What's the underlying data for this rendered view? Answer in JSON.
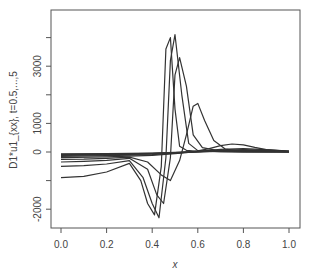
{
  "chart_data": {
    "type": "line",
    "title": "",
    "xlabel": "x",
    "ylabel": "D1*u1_{xx}, t=0.5,...,5",
    "xlim": [
      0.0,
      1.0
    ],
    "ylim": [
      -2600,
      5200
    ],
    "x_ticks": [
      "0.0",
      "0.2",
      "0.4",
      "0.6",
      "0.8",
      "1.0"
    ],
    "y_ticks": [
      "-2000",
      "0",
      "1000",
      "3000"
    ],
    "grid": false,
    "legend": null,
    "series": [
      {
        "name": "t=0.5",
        "x": [
          0,
          0.1,
          0.2,
          0.3,
          0.35,
          0.38,
          0.41,
          0.44,
          0.46,
          0.48,
          0.5,
          0.52,
          0.55,
          0.6,
          0.7,
          0.8,
          1.0
        ],
        "values": [
          -900,
          -850,
          -700,
          -400,
          -1000,
          -1800,
          -2200,
          -500,
          3600,
          4000,
          1500,
          200,
          60,
          20,
          10,
          5,
          0
        ]
      },
      {
        "name": "t=1.0",
        "x": [
          0,
          0.1,
          0.2,
          0.3,
          0.36,
          0.4,
          0.43,
          0.46,
          0.48,
          0.5,
          0.53,
          0.56,
          0.6,
          0.7,
          0.8,
          1.0
        ],
        "values": [
          -500,
          -480,
          -420,
          -300,
          -900,
          -1800,
          -2300,
          -200,
          3200,
          4100,
          2000,
          300,
          50,
          10,
          5,
          0
        ]
      },
      {
        "name": "t=1.5",
        "x": [
          0,
          0.1,
          0.2,
          0.3,
          0.38,
          0.42,
          0.45,
          0.48,
          0.5,
          0.52,
          0.55,
          0.58,
          0.62,
          0.7,
          0.8,
          1.0
        ],
        "values": [
          -350,
          -330,
          -290,
          -220,
          -600,
          -1500,
          -1800,
          -200,
          2700,
          3300,
          2300,
          600,
          150,
          30,
          10,
          0
        ]
      },
      {
        "name": "t=2.0",
        "x": [
          0,
          0.1,
          0.2,
          0.3,
          0.38,
          0.44,
          0.48,
          0.52,
          0.55,
          0.58,
          0.6,
          0.63,
          0.67,
          0.72,
          0.8,
          1.0
        ],
        "values": [
          -260,
          -250,
          -220,
          -180,
          -350,
          -800,
          -1000,
          -300,
          600,
          1600,
          1700,
          1100,
          400,
          100,
          20,
          0
        ]
      },
      {
        "name": "t=2.5",
        "x": [
          0,
          0.2,
          0.4,
          0.5,
          0.55,
          0.6,
          0.65,
          0.7,
          0.75,
          0.8,
          0.85,
          0.9,
          1.0
        ],
        "values": [
          -200,
          -170,
          -120,
          -60,
          -20,
          40,
          120,
          220,
          280,
          250,
          160,
          80,
          20
        ]
      },
      {
        "name": "t=3.0",
        "x": [
          0,
          0.2,
          0.4,
          0.5,
          0.6,
          0.7,
          0.8,
          0.9,
          1.0
        ],
        "values": [
          -150,
          -130,
          -90,
          -40,
          20,
          90,
          120,
          80,
          30
        ]
      },
      {
        "name": "t=3.5",
        "x": [
          0,
          0.2,
          0.4,
          0.5,
          0.6,
          0.7,
          0.8,
          0.9,
          1.0
        ],
        "values": [
          -120,
          -100,
          -70,
          -30,
          15,
          60,
          80,
          60,
          25
        ]
      },
      {
        "name": "t=4.0",
        "x": [
          0,
          0.2,
          0.4,
          0.5,
          0.6,
          0.7,
          0.8,
          0.9,
          1.0
        ],
        "values": [
          -100,
          -85,
          -55,
          -25,
          10,
          45,
          60,
          45,
          20
        ]
      },
      {
        "name": "t=4.5",
        "x": [
          0,
          0.2,
          0.4,
          0.5,
          0.6,
          0.7,
          0.8,
          0.9,
          1.0
        ],
        "values": [
          -80,
          -70,
          -45,
          -20,
          8,
          35,
          45,
          35,
          15
        ]
      },
      {
        "name": "t=5.0",
        "x": [
          0,
          0.2,
          0.4,
          0.5,
          0.6,
          0.7,
          0.8,
          0.9,
          1.0
        ],
        "values": [
          -65,
          -55,
          -35,
          -15,
          6,
          28,
          36,
          28,
          12
        ]
      }
    ]
  }
}
